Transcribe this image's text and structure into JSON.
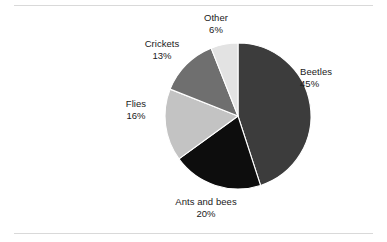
{
  "figure": {
    "background_color": "#ffffff",
    "rule_color": "#d9d9d9",
    "label_color": "#1a1a1a"
  },
  "chart_data": {
    "type": "pie",
    "title": "",
    "subtitle": "",
    "xlabel": "",
    "ylabel": "",
    "legend_position": "none",
    "grid": false,
    "labels_inline": true,
    "units": "%",
    "total": 100,
    "start_angle_deg": 0,
    "direction": "clockwise",
    "categories": [
      "Beetles",
      "Ants and bees",
      "Flies",
      "Crickets",
      "Other"
    ],
    "values": [
      45,
      20,
      16,
      13,
      6
    ],
    "slices": [
      {
        "name": "Beetles",
        "value": 45,
        "value_label": "45%",
        "color": "#3c3c3c",
        "start_pct": 0,
        "end_pct": 45
      },
      {
        "name": "Ants and bees",
        "value": 20,
        "value_label": "20%",
        "color": "#0d0d0d",
        "start_pct": 45,
        "end_pct": 65
      },
      {
        "name": "Flies",
        "value": 16,
        "value_label": "16%",
        "color": "#c3c3c3",
        "start_pct": 65,
        "end_pct": 81
      },
      {
        "name": "Crickets",
        "value": 13,
        "value_label": "13%",
        "color": "#6f6f6f",
        "start_pct": 81,
        "end_pct": 94
      },
      {
        "name": "Other",
        "value": 6,
        "value_label": "6%",
        "color": "#e3e3e3",
        "start_pct": 94,
        "end_pct": 100
      }
    ],
    "geometry": {
      "center_x": 238,
      "center_y": 116,
      "radius": 73
    }
  }
}
